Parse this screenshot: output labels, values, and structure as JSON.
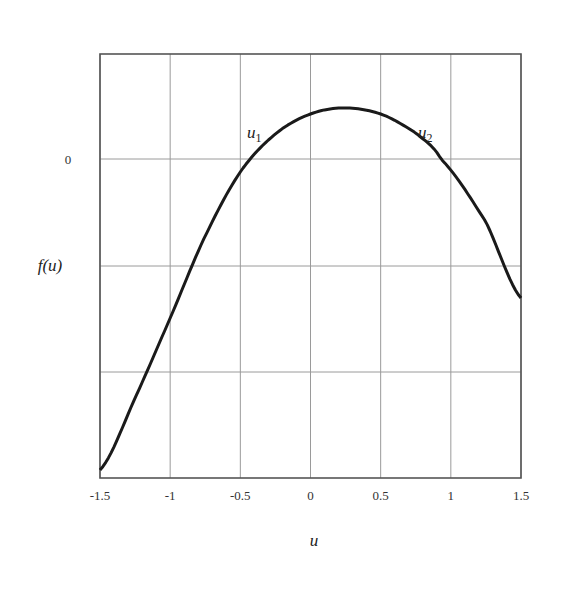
{
  "chart_data": {
    "type": "line",
    "title": "",
    "xlabel": "u",
    "ylabel": "f(u)",
    "xlim": [
      -1.5,
      1.5
    ],
    "x_ticks": [
      "-1.5",
      "-1",
      "-0.5",
      "0",
      "0.5",
      "1",
      "1.5"
    ],
    "y_ticks": [
      "0"
    ],
    "grid": true,
    "annotations": [
      {
        "text": "u",
        "sub": "1",
        "near_x": -0.5
      },
      {
        "text": "u",
        "sub": "2",
        "near_x": 0.93
      }
    ],
    "series": [
      {
        "name": "f(u)",
        "x": [
          -1.5,
          -1.25,
          -1.0,
          -0.75,
          -0.5,
          -0.25,
          0.0,
          0.24,
          0.5,
          0.75,
          0.93,
          1.25,
          1.5
        ],
        "y_px": [
          470,
          398,
          318,
          236,
          172,
          134,
          114,
          108,
          114,
          133,
          159,
          222,
          298
        ]
      }
    ],
    "roots": [
      -0.5,
      0.93
    ],
    "peak": {
      "u": 0.24
    }
  },
  "labels": {
    "xlabel": "u",
    "ylabel": "f(u)",
    "zero": "0",
    "u1": "u",
    "u1_sub": "1",
    "u2": "u",
    "u2_sub": "2"
  }
}
